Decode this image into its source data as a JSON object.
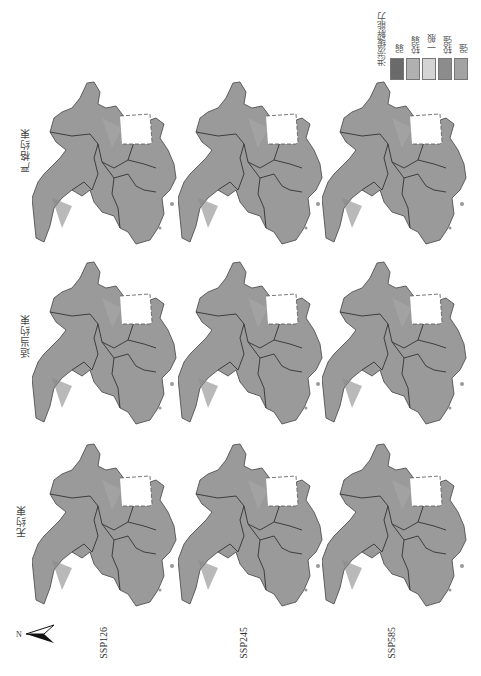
{
  "figure": {
    "rows": [
      {
        "label": "严格约束"
      },
      {
        "label": "适当约束"
      },
      {
        "label": "无约束"
      }
    ],
    "columns": [
      {
        "label": "SSP126"
      },
      {
        "label": "SSP245"
      },
      {
        "label": "SSP585"
      }
    ],
    "north_label": "N",
    "legend": {
      "title": "洪涝缓解能力",
      "items": [
        {
          "label": "弱",
          "color": "#6a6a6a"
        },
        {
          "label": "较弱",
          "color": "#b0b0b0"
        },
        {
          "label": "一般",
          "color": "#d4d4d4"
        },
        {
          "label": "较强",
          "color": "#8c8c8c"
        },
        {
          "label": "强",
          "color": "#a3a3a3"
        }
      ]
    },
    "colors": {
      "map_fill": "#9a9a9a",
      "boundary": "#333333",
      "inset_box": "#555555"
    }
  }
}
